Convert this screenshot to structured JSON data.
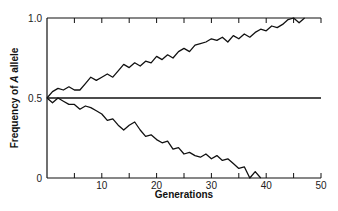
{
  "chart_data": {
    "type": "line",
    "title": "",
    "xlabel": "Generations",
    "ylabel_parts": [
      "Frequency of ",
      "A",
      " allele"
    ],
    "ylabel": "Frequency of A allele",
    "xlim": [
      0,
      50
    ],
    "ylim": [
      0,
      1.0
    ],
    "x_ticks": [
      10,
      20,
      30,
      40,
      50
    ],
    "x_minor_ticks": [
      5,
      15,
      25,
      35,
      45
    ],
    "y_ticks": [
      0,
      0.5,
      1.0
    ],
    "y_tick_labels": [
      "0",
      "0.5",
      "1.0"
    ],
    "grid": false,
    "legend": null,
    "series": [
      {
        "name": "reference",
        "x": [
          0,
          50
        ],
        "y": [
          0.5,
          0.5
        ]
      },
      {
        "name": "drift-up",
        "x": [
          0,
          1,
          2,
          3,
          4,
          5,
          6,
          7,
          8,
          9,
          10,
          11,
          12,
          13,
          14,
          15,
          16,
          17,
          18,
          19,
          20,
          21,
          22,
          23,
          24,
          25,
          26,
          27,
          28,
          29,
          30,
          31,
          32,
          33,
          34,
          35,
          36,
          37,
          38,
          39,
          40,
          41,
          42,
          43,
          44,
          45,
          46,
          47
        ],
        "y": [
          0.5,
          0.54,
          0.56,
          0.55,
          0.57,
          0.55,
          0.55,
          0.59,
          0.63,
          0.61,
          0.63,
          0.65,
          0.63,
          0.67,
          0.71,
          0.69,
          0.72,
          0.7,
          0.73,
          0.72,
          0.76,
          0.74,
          0.77,
          0.75,
          0.79,
          0.81,
          0.79,
          0.83,
          0.84,
          0.85,
          0.87,
          0.86,
          0.88,
          0.85,
          0.89,
          0.87,
          0.9,
          0.88,
          0.91,
          0.93,
          0.92,
          0.95,
          0.94,
          0.96,
          0.99,
          1.0,
          0.97,
          1.0
        ]
      },
      {
        "name": "drift-down",
        "x": [
          0,
          1,
          2,
          3,
          4,
          5,
          6,
          7,
          8,
          9,
          10,
          11,
          12,
          13,
          14,
          15,
          16,
          17,
          18,
          19,
          20,
          21,
          22,
          23,
          24,
          25,
          26,
          27,
          28,
          29,
          30,
          31,
          32,
          33,
          34,
          35,
          36,
          37,
          38,
          39
        ],
        "y": [
          0.5,
          0.47,
          0.5,
          0.48,
          0.46,
          0.46,
          0.43,
          0.45,
          0.44,
          0.42,
          0.4,
          0.36,
          0.37,
          0.33,
          0.3,
          0.33,
          0.35,
          0.3,
          0.26,
          0.27,
          0.24,
          0.22,
          0.23,
          0.18,
          0.19,
          0.15,
          0.16,
          0.14,
          0.13,
          0.15,
          0.12,
          0.14,
          0.11,
          0.12,
          0.09,
          0.06,
          0.07,
          0.0,
          0.04,
          0.0
        ]
      }
    ]
  }
}
